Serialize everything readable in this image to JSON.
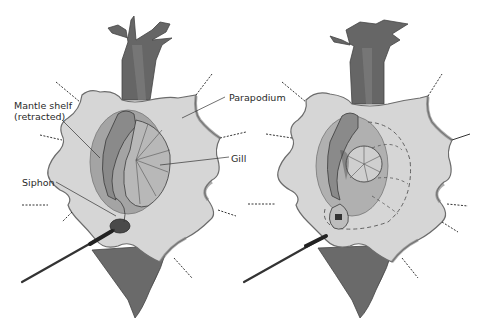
{
  "figure": {
    "panels": [
      {
        "id": "left",
        "description": "parapodia pinned open showing mantle shelf retracted, gill and siphon"
      },
      {
        "id": "right",
        "description": "same preparation with dashed outline indicating gill/mantle position"
      }
    ]
  },
  "labels": {
    "mantle_shelf_line1": "Mantle shelf",
    "mantle_shelf_line2": "(retracted)",
    "parapodium": "Parapodium",
    "gill": "Gill",
    "siphon": "Siphon"
  },
  "colors": {
    "body_dark": "#5e5e5e",
    "body_mid": "#7d7d7d",
    "parapodium_fill": "#d4d4d4",
    "parapodium_edge": "#6c6c6c",
    "cavity": "#9a9a9a",
    "gill": "#b5b5b5",
    "outline": "#3a3a3a",
    "pin_dash": "#333333",
    "label_text": "#2a2a2a"
  }
}
